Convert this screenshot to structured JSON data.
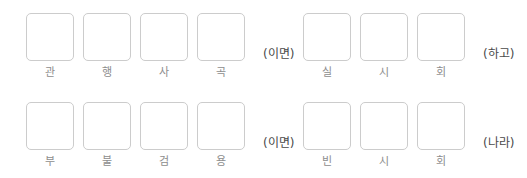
{
  "worksheet": {
    "rows": [
      {
        "groups": [
          {
            "cells": [
              {
                "hint": "관"
              },
              {
                "hint": "행"
              },
              {
                "hint": "사"
              },
              {
                "hint": "곡"
              }
            ],
            "meaning": "(이면)"
          },
          {
            "cells": [
              {
                "hint": "실"
              },
              {
                "hint": "시"
              },
              {
                "hint": "회"
              }
            ],
            "meaning": "(하고)"
          }
        ]
      },
      {
        "groups": [
          {
            "cells": [
              {
                "hint": "부"
              },
              {
                "hint": "불"
              },
              {
                "hint": "검"
              },
              {
                "hint": "용"
              }
            ],
            "meaning": "(이면)"
          },
          {
            "cells": [
              {
                "hint": "빈"
              },
              {
                "hint": "시"
              },
              {
                "hint": "회"
              }
            ],
            "meaning": "(나라)"
          }
        ]
      }
    ]
  }
}
